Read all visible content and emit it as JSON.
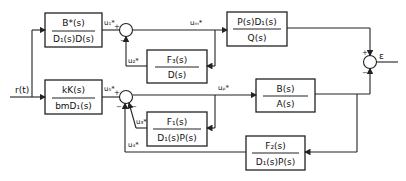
{
  "diagram": {
    "input": "r(t)",
    "output": "ε",
    "blocks": {
      "b1": {
        "num": "B*(s)",
        "den": "D₁(s)D(s)"
      },
      "b2": {
        "num": "kK(s)",
        "den": "bmD₁(s)"
      },
      "b3": {
        "num": "P(s)D₁(s)",
        "den": "Q(s)"
      },
      "b4": {
        "num": "F₃(s)",
        "den": "D(s)"
      },
      "b5": {
        "num": "B(s)",
        "den": "A(s)"
      },
      "b6": {
        "num": "F₁(s)",
        "den": "D₁(s)P(s)"
      },
      "b7": {
        "num": "F₂(s)",
        "den": "D₁(s)P(s)"
      }
    },
    "signals": {
      "u1": "u₁*",
      "u2": "u₂*",
      "u3": "u₃*",
      "u4": "u₄*",
      "u5": "u₅*",
      "um": "uₘ*",
      "up": "uₚ*"
    },
    "signs": {
      "plus": "+",
      "minus": "−"
    }
  }
}
